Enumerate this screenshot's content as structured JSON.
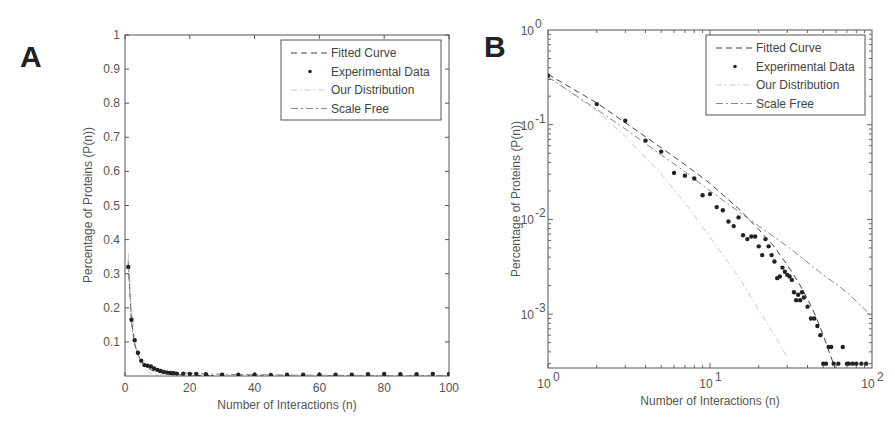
{
  "figure": {
    "panels": [
      "A",
      "B"
    ]
  },
  "chart_data": [
    {
      "panel": "A",
      "type": "line",
      "title": "",
      "xlabel": "Number of Interactions (n)",
      "ylabel": "Percentage of Proteins (P(n))",
      "xlim": [
        0,
        100
      ],
      "ylim": [
        0,
        1
      ],
      "xscale": "linear",
      "yscale": "linear",
      "xticks": [
        "0",
        "20",
        "40",
        "60",
        "80",
        "100"
      ],
      "yticks": [
        "0.1",
        "0.2",
        "0.3",
        "0.4",
        "0.5",
        "0.6",
        "0.7",
        "0.8",
        "0.9",
        "1"
      ],
      "grid": false,
      "legend_position": "upper right",
      "legend": [
        "Fitted Curve",
        "Experimental Data",
        "Our Distribution",
        "Scale Free"
      ],
      "series": [
        {
          "name": "Experimental Data",
          "style": "markers",
          "x": [
            1,
            2,
            3,
            4,
            5,
            6,
            7,
            8,
            9,
            10,
            11,
            12,
            13,
            14,
            15,
            16,
            18,
            20,
            22,
            25,
            30,
            35,
            40,
            45,
            50,
            55,
            60,
            65,
            70,
            75,
            80,
            85,
            90,
            95,
            100
          ],
          "y": [
            0.32,
            0.165,
            0.105,
            0.068,
            0.045,
            0.032,
            0.03,
            0.028,
            0.022,
            0.018,
            0.015,
            0.012,
            0.01,
            0.009,
            0.008,
            0.007,
            0.007,
            0.006,
            0.006,
            0.005,
            0.004,
            0.004,
            0.004,
            0.003,
            0.004,
            0.004,
            0.004,
            0.004,
            0.004,
            0.005,
            0.006,
            0.005,
            0.005,
            0.006,
            0.006
          ]
        },
        {
          "name": "Fitted Curve",
          "style": "dashed",
          "x": [
            1,
            2,
            3,
            4,
            5,
            6,
            8,
            10,
            15,
            20,
            30,
            50,
            100
          ],
          "y": [
            0.33,
            0.16,
            0.095,
            0.062,
            0.043,
            0.031,
            0.018,
            0.011,
            0.004,
            0.002,
            0.001,
            0.0005,
            0.0002
          ]
        },
        {
          "name": "Our Distribution",
          "style": "dash-dot-light",
          "x": [
            1,
            2,
            3,
            4,
            5,
            6,
            8,
            10,
            15,
            20,
            30,
            50,
            100
          ],
          "y": [
            0.36,
            0.2,
            0.11,
            0.06,
            0.035,
            0.02,
            0.008,
            0.004,
            0.001,
            0.0005,
            0.0002,
            0.0001,
            0.0001
          ]
        },
        {
          "name": "Scale Free",
          "style": "dash-dot",
          "x": [
            1,
            2,
            3,
            4,
            5,
            6,
            8,
            10,
            15,
            20,
            30,
            50,
            100
          ],
          "y": [
            0.34,
            0.15,
            0.09,
            0.06,
            0.045,
            0.036,
            0.025,
            0.019,
            0.011,
            0.008,
            0.005,
            0.0025,
            0.0009
          ]
        }
      ]
    },
    {
      "panel": "B",
      "type": "scatter",
      "title": "",
      "xlabel": "Number of Interactions (n)",
      "ylabel": "Percentage of Proteins (P(n))",
      "xlim": [
        1,
        100
      ],
      "ylim": [
        0.00027,
        1
      ],
      "xscale": "log",
      "yscale": "log",
      "xticks": [
        "10^0",
        "10^1",
        "10^2"
      ],
      "yticks": [
        "10^0",
        "10^-1",
        "10^-2",
        "10^-3"
      ],
      "grid": false,
      "legend_position": "upper right",
      "legend": [
        "Fitted Curve",
        "Experimental Data",
        "Our Distribution",
        "Scale Free"
      ],
      "series": [
        {
          "name": "Experimental Data",
          "style": "markers",
          "x": [
            1,
            2,
            3,
            4,
            5,
            6,
            7,
            8,
            9,
            10,
            11,
            12,
            13,
            14,
            15,
            16,
            17,
            18,
            19,
            20,
            21,
            22,
            23,
            24,
            25,
            26,
            27,
            28,
            29,
            30,
            31,
            32,
            33,
            34,
            35,
            36,
            37,
            38,
            40,
            42,
            44,
            46,
            48,
            50,
            52,
            54,
            56,
            58,
            62,
            66,
            70,
            72,
            76,
            80,
            86,
            92
          ],
          "y": [
            0.33,
            0.165,
            0.11,
            0.068,
            0.052,
            0.031,
            0.029,
            0.027,
            0.018,
            0.0185,
            0.0135,
            0.0125,
            0.0095,
            0.0085,
            0.0105,
            0.0068,
            0.0062,
            0.0066,
            0.0066,
            0.0052,
            0.0042,
            0.0062,
            0.0052,
            0.0042,
            0.0036,
            0.0024,
            0.0025,
            0.0031,
            0.0028,
            0.0026,
            0.0025,
            0.0023,
            0.0017,
            0.0014,
            0.0016,
            0.0014,
            0.0017,
            0.0015,
            0.0012,
            0.0009,
            0.0009,
            0.00075,
            0.0006,
            0.0003,
            0.0003,
            0.00045,
            0.00045,
            0.0003,
            0.0003,
            0.00045,
            0.0003,
            0.0003,
            0.0003,
            0.0003,
            0.0003,
            0.0003
          ]
        },
        {
          "name": "Fitted Curve",
          "style": "dashed",
          "x": [
            1,
            2,
            3,
            5,
            7,
            10,
            15,
            20,
            25,
            30,
            35,
            40,
            45,
            50,
            55,
            60
          ],
          "y": [
            0.34,
            0.17,
            0.105,
            0.057,
            0.038,
            0.024,
            0.013,
            0.0078,
            0.0051,
            0.0033,
            0.0022,
            0.00145,
            0.00095,
            0.0006,
            0.00038,
            0.00025
          ]
        },
        {
          "name": "Our Distribution",
          "style": "dash-dot-light",
          "x": [
            1,
            2,
            3,
            5,
            7,
            10,
            15,
            20,
            25,
            30
          ],
          "y": [
            0.32,
            0.14,
            0.075,
            0.03,
            0.015,
            0.0065,
            0.0025,
            0.0011,
            0.0006,
            0.00035
          ]
        },
        {
          "name": "Scale Free",
          "style": "dash-dot",
          "x": [
            1,
            2,
            3,
            5,
            7,
            10,
            20,
            30,
            50,
            70,
            100
          ],
          "y": [
            0.32,
            0.145,
            0.09,
            0.048,
            0.032,
            0.02,
            0.0085,
            0.0052,
            0.0026,
            0.0017,
            0.00095
          ]
        }
      ]
    }
  ]
}
